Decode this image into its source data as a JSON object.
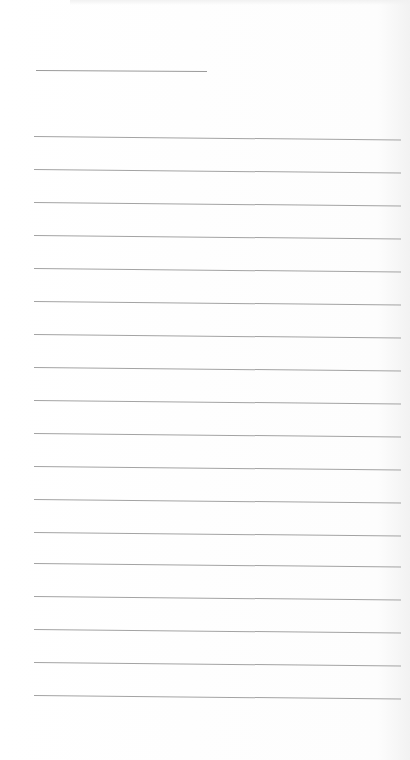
{
  "page": {
    "type": "blank lined notepaper",
    "background_color": "#fefefe",
    "line_color": "#a3a3a3",
    "title_line": {
      "top": 70,
      "left": 36,
      "width": 171
    },
    "rules": [
      {
        "top": 136
      },
      {
        "top": 169
      },
      {
        "top": 202
      },
      {
        "top": 235
      },
      {
        "top": 268
      },
      {
        "top": 301
      },
      {
        "top": 334
      },
      {
        "top": 367
      },
      {
        "top": 400
      },
      {
        "top": 433
      },
      {
        "top": 466
      },
      {
        "top": 499
      },
      {
        "top": 532
      },
      {
        "top": 563
      },
      {
        "top": 596
      },
      {
        "top": 629
      },
      {
        "top": 662
      },
      {
        "top": 695
      }
    ]
  }
}
